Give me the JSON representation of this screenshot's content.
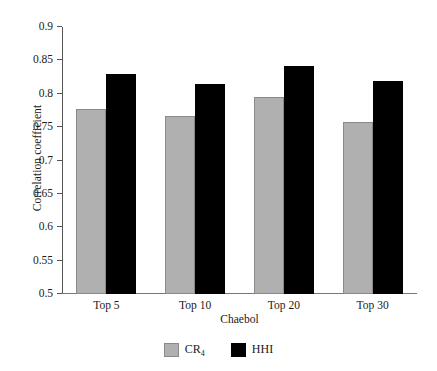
{
  "chart_data": {
    "type": "bar",
    "title": "",
    "subtitle": "",
    "xlabel": "Chaebol",
    "ylabel": "Correlation coefficient",
    "categories": [
      "Top 5",
      "Top 10",
      "Top 20",
      "Top 30"
    ],
    "series": [
      {
        "name": "CR4",
        "legend_label": "CR",
        "legend_sub": "4",
        "color": "#b0b0b0",
        "edge_color": "#8a8a8a",
        "values": [
          0.777,
          0.767,
          0.795,
          0.758
        ]
      },
      {
        "name": "HHI",
        "legend_label": "HHI",
        "legend_sub": "",
        "color": "#000000",
        "edge_color": "#000000",
        "values": [
          0.83,
          0.815,
          0.841,
          0.819
        ]
      }
    ],
    "ylim": [
      0.5,
      0.9
    ],
    "yticks": [
      0.5,
      0.55,
      0.6,
      0.65,
      0.7,
      0.75,
      0.8,
      0.85,
      0.9
    ],
    "ytick_labels": [
      "0.5",
      "0.55",
      "0.6",
      "0.65",
      "0.7",
      "0.75",
      "0.8",
      "0.85",
      "0.9"
    ],
    "grid": false,
    "legend_position": "bottom-center",
    "background_color": "#ffffff",
    "axis_color": "#555555"
  }
}
